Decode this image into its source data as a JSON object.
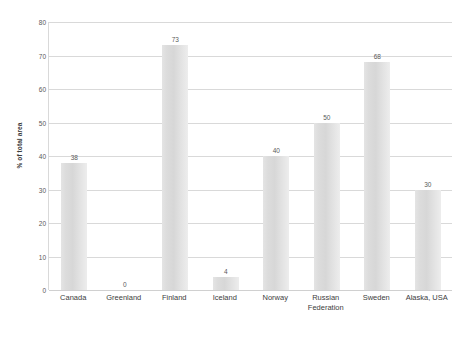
{
  "chart_data": {
    "type": "bar",
    "title": "",
    "xlabel": "",
    "ylabel": "% of total area",
    "ylim": [
      0,
      80
    ],
    "yticks": [
      0,
      10,
      20,
      30,
      40,
      50,
      60,
      70,
      80
    ],
    "grid": true,
    "legend": "none",
    "categories": [
      "Canada",
      "Greenland",
      "Finland",
      "Iceland",
      "Norway",
      "Russian\nFederation",
      "Sweden",
      "Alaska, USA"
    ],
    "values": [
      38,
      0,
      73,
      4,
      40,
      50,
      68,
      30
    ],
    "data_labels": [
      "38",
      "0",
      "73",
      "4",
      "40",
      "50",
      "68",
      "30"
    ],
    "colors": {
      "bar_fill": "#dcdcdc",
      "gridline": "#d9d9d9",
      "axis": "#d0d0d0",
      "text": "#3d3d3d",
      "background": "#ffffff"
    }
  }
}
